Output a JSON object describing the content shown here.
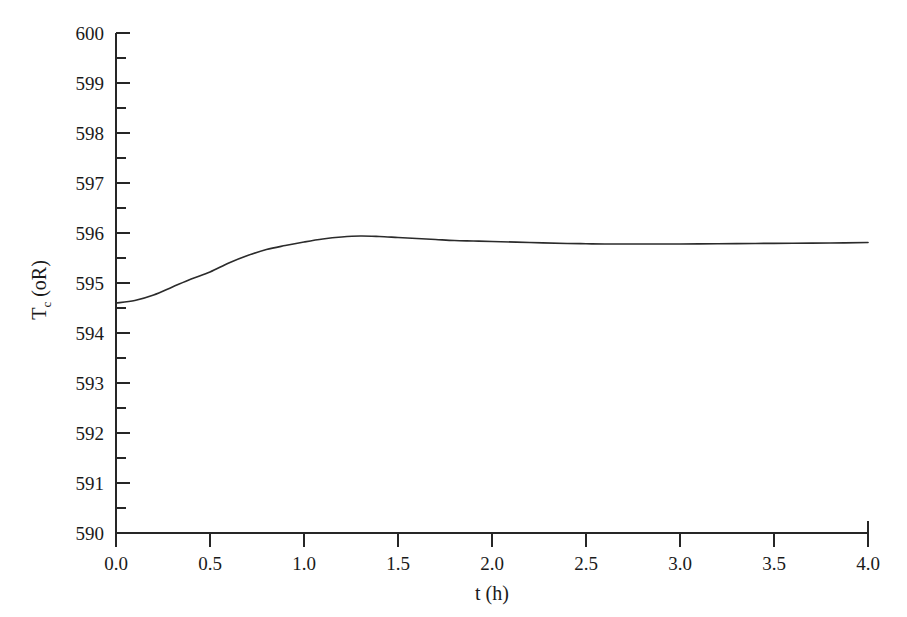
{
  "figure": {
    "background_color": "#ffffff",
    "line_color": "#2b2b2b",
    "axis_color": "#262626"
  },
  "chart_data": {
    "type": "line",
    "title": "",
    "xlabel": "t (h)",
    "ylabel": "T_c (oR)",
    "ylabel_base": "T",
    "ylabel_subscript": "c",
    "ylabel_units": "(oR)",
    "xlim": [
      0.0,
      4.0
    ],
    "ylim": [
      590,
      600
    ],
    "grid": false,
    "legend": null,
    "x_ticks": [
      0.0,
      0.5,
      1.0,
      1.5,
      2.0,
      2.5,
      3.0,
      3.5,
      4.0
    ],
    "x_tick_labels": [
      "0.0",
      "0.5",
      "1.0",
      "1.5",
      "2.0",
      "2.5",
      "3.0",
      "3.5",
      "4.0"
    ],
    "y_ticks": [
      590,
      591,
      592,
      593,
      594,
      595,
      596,
      597,
      598,
      599,
      600
    ],
    "y_tick_labels": [
      "590",
      "591",
      "592",
      "593",
      "594",
      "595",
      "596",
      "597",
      "598",
      "599",
      "600"
    ],
    "y_minor_ticks": [
      590.5,
      591.5,
      592.5,
      593.5,
      594.5,
      595.5,
      596.5,
      597.5,
      598.5,
      599.5
    ],
    "series": [
      {
        "name": "Tc",
        "x": [
          0.0,
          0.1,
          0.2,
          0.3,
          0.4,
          0.5,
          0.6,
          0.7,
          0.8,
          0.9,
          1.0,
          1.1,
          1.2,
          1.3,
          1.4,
          1.5,
          1.6,
          1.7,
          1.8,
          1.9,
          2.0,
          2.2,
          2.4,
          2.5,
          2.6,
          2.8,
          3.0,
          3.2,
          3.4,
          3.6,
          3.8,
          4.0
        ],
        "y": [
          594.6,
          594.65,
          594.76,
          594.92,
          595.08,
          595.22,
          595.4,
          595.55,
          595.67,
          595.75,
          595.82,
          595.88,
          595.92,
          595.94,
          595.93,
          595.91,
          595.89,
          595.87,
          595.85,
          595.84,
          595.83,
          595.81,
          595.79,
          595.785,
          595.78,
          595.78,
          595.78,
          595.785,
          595.79,
          595.795,
          595.8,
          595.81
        ]
      }
    ],
    "annotations": []
  },
  "geometry": {
    "plot_left_px": 116,
    "plot_right_px": 868,
    "plot_top_px": 33,
    "plot_bottom_px": 533
  }
}
